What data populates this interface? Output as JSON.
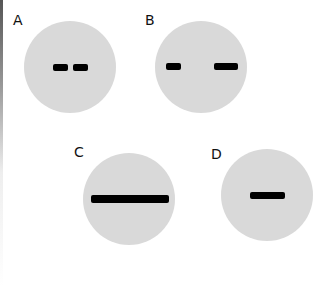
{
  "panels": [
    {
      "label": "A",
      "disc_color": "#d9d9d9",
      "bands": 2,
      "description": "two short bands close together"
    },
    {
      "label": "B",
      "disc_color": "#d9d9d9",
      "bands": 2,
      "description": "two bands far apart, right band longer"
    },
    {
      "label": "C",
      "disc_color": "#d9d9d9",
      "bands": 1,
      "description": "one long continuous band"
    },
    {
      "label": "D",
      "disc_color": "#d9d9d9",
      "bands": 1,
      "description": "one short centered band"
    }
  ],
  "colors": {
    "disc": "#d9d9d9",
    "band": "#000000",
    "background": "#ffffff"
  }
}
